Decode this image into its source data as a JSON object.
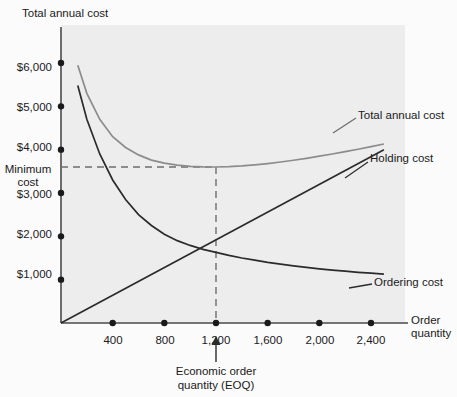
{
  "chart_data": {
    "type": "line",
    "title": "",
    "ylabel": "Total annual cost",
    "xlabel_line1": "Order",
    "xlabel_line2": "quantity",
    "xlabel": "Order quantity",
    "grid": false,
    "legend_position": "right-inline",
    "xlim": [
      0,
      2650
    ],
    "ylim": [
      0,
      6600
    ],
    "x_ticks": [
      400,
      800,
      1200,
      1600,
      2000,
      2400
    ],
    "x_tick_labels": [
      "400",
      "800",
      "1,200",
      "1,600",
      "2,000",
      "2,400"
    ],
    "y_ticks": [
      1000,
      2000,
      3000,
      4000,
      5000,
      6000
    ],
    "y_tick_labels": [
      "$1,000",
      "$2,000",
      "$3,000",
      "$4,000",
      "$5,000",
      "$6,000"
    ],
    "annotations": {
      "minimum_cost_label_line1": "Minimum",
      "minimum_cost_label_line2": "cost",
      "minimum_cost_value": 3600,
      "eoq_label_line1": "Economic order",
      "eoq_label_line2": "quantity (EOQ)",
      "eoq_value": 1200
    },
    "series": [
      {
        "name": "Total annual cost",
        "label": "Total annual cost",
        "color": "#8c8c8c",
        "x": [
          130,
          200,
          300,
          400,
          500,
          600,
          700,
          800,
          900,
          1000,
          1100,
          1200,
          1300,
          1400,
          1500,
          1600,
          1700,
          1800,
          1900,
          2000,
          2100,
          2200,
          2300,
          2400,
          2500
        ],
        "y": [
          5950,
          5300,
          4700,
          4300,
          4050,
          3880,
          3760,
          3690,
          3645,
          3615,
          3602,
          3600,
          3608,
          3625,
          3650,
          3680,
          3715,
          3755,
          3800,
          3850,
          3900,
          3955,
          4010,
          4070,
          4130
        ]
      },
      {
        "name": "Ordering cost",
        "label": "Ordering cost",
        "color": "#333333",
        "x": [
          130,
          200,
          300,
          400,
          500,
          600,
          700,
          800,
          900,
          1000,
          1100,
          1200,
          1300,
          1400,
          1500,
          1600,
          1700,
          1800,
          1900,
          2000,
          2100,
          2200,
          2300,
          2400,
          2500
        ],
        "y": [
          5480,
          4700,
          3900,
          3300,
          2850,
          2500,
          2250,
          2050,
          1900,
          1790,
          1700,
          1630,
          1560,
          1500,
          1450,
          1400,
          1360,
          1320,
          1285,
          1250,
          1220,
          1195,
          1170,
          1150,
          1130
        ]
      },
      {
        "name": "Holding cost",
        "label": "Holding cost",
        "color": "#333333",
        "x": [
          0,
          2500
        ],
        "y": [
          0,
          4000
        ]
      }
    ],
    "intersection_point": {
      "x": 1200,
      "y": 1830
    }
  }
}
